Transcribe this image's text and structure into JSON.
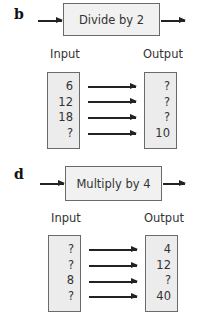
{
  "parts": [
    {
      "letter": "b",
      "function_label": "Divide by 2",
      "input_header": "Input",
      "output_header": "Output",
      "rows": [
        {
          "input": "6",
          "output": "?"
        },
        {
          "input": "12",
          "output": "?"
        },
        {
          "input": "18",
          "output": "?"
        },
        {
          "input": "?",
          "output": "10"
        }
      ]
    },
    {
      "letter": "d",
      "function_label": "Multiply by 4",
      "input_header": "Input",
      "output_header": "Output",
      "rows": [
        {
          "input": "?",
          "output": "4"
        },
        {
          "input": "?",
          "output": "12"
        },
        {
          "input": "8",
          "output": "?"
        },
        {
          "input": "?",
          "output": "40"
        }
      ]
    }
  ],
  "colors": {
    "box_fill": "#ececec",
    "border": "#6a6a6a",
    "arrow": "#222222"
  }
}
